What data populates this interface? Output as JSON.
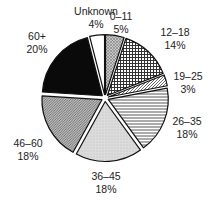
{
  "chart_data": {
    "type": "pie",
    "title": "",
    "start_angle_deg": 0,
    "direction": "clockwise",
    "exploded": true,
    "slices": [
      {
        "label": "0–11",
        "value": 5,
        "value_label": "5%",
        "pattern": "fine-crosshatch-gray",
        "label_pos": [
          121,
          10
        ]
      },
      {
        "label": "12–18",
        "value": 14,
        "value_label": "14%",
        "pattern": "grid-crosshatch",
        "label_pos": [
          175,
          26
        ]
      },
      {
        "label": "19–25",
        "value": 3,
        "value_label": "3%",
        "pattern": "diagonal-hatch",
        "label_pos": [
          188,
          70
        ]
      },
      {
        "label": "26–35",
        "value": 18,
        "value_label": "18%",
        "pattern": "horizontal-lines",
        "label_pos": [
          187,
          115
        ]
      },
      {
        "label": "36–45",
        "value": 18,
        "value_label": "18%",
        "pattern": "light-gray-dots",
        "label_pos": [
          106,
          170
        ]
      },
      {
        "label": "46–60",
        "value": 18,
        "value_label": "18%",
        "pattern": "dense-diagonal",
        "label_pos": [
          28,
          137
        ]
      },
      {
        "label": "60+",
        "value": 20,
        "value_label": "20%",
        "pattern": "solid-black",
        "label_pos": [
          37,
          30
        ]
      },
      {
        "label": "Unknown",
        "value": 4,
        "value_label": "4%",
        "pattern": "white",
        "label_pos": [
          96,
          5
        ]
      }
    ]
  },
  "colors": {
    "outline": "#111111",
    "solid_black": "#0a0a0a",
    "light_gray": "#d6d6d6",
    "mid_gray": "#9a9a9a",
    "white": "#ffffff"
  }
}
